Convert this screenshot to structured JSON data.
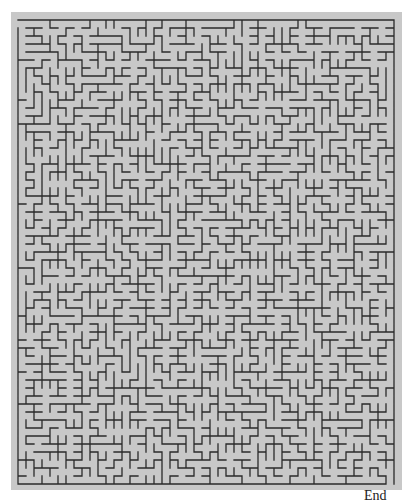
{
  "maze": {
    "cols": 47,
    "rows": 58,
    "cell_size": 8,
    "origin_x": 18,
    "origin_y": 20,
    "seed": 20240611,
    "background_color": "#c8c8c8",
    "wall_color": "#2a2a2a",
    "wall_width": 1.3,
    "entrance": {
      "side": "left",
      "row": 0
    },
    "exit": {
      "side": "bottom",
      "col": 46
    }
  },
  "labels": {
    "end": "End"
  }
}
